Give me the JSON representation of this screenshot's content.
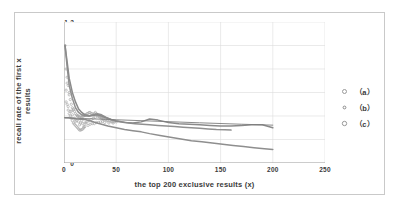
{
  "chart_data": {
    "type": "scatter",
    "title": "",
    "xlabel": "the top 200 exclusive results (x)",
    "ylabel_line1": "recall rate of the first x",
    "ylabel_line2": "results",
    "xlim": [
      0,
      250
    ],
    "ylim": [
      0,
      1.2
    ],
    "xticks": [
      0,
      50,
      100,
      150,
      200,
      250
    ],
    "yticks": [
      0,
      0.2,
      0.4,
      0.6,
      0.8,
      1,
      1.2
    ],
    "xtick_labels": [
      "0",
      "50",
      "100",
      "150",
      "200",
      "250"
    ],
    "ytick_labels": [
      "0",
      "0.2",
      "0.4",
      "0.6",
      "0.8",
      "1",
      "1.2"
    ],
    "grid": "both",
    "legend_position": "right",
    "legend": [
      {
        "label": "（a）",
        "marker": "circle-open",
        "color": "#9a9a9a"
      },
      {
        "label": "（b）",
        "marker": "circle-open",
        "color": "#8a8a8a"
      },
      {
        "label": "（c）",
        "marker": "circle-open",
        "color": "#8e8e8e"
      }
    ],
    "series": [
      {
        "name": "（a）",
        "color": "#909090",
        "x": [
          1,
          3,
          5,
          8,
          11,
          14,
          17,
          20,
          24,
          28,
          32,
          36,
          40,
          45,
          50,
          56,
          62,
          68,
          75,
          82,
          90,
          98,
          106,
          114,
          122,
          130,
          138,
          146,
          154,
          160
        ],
        "y": [
          1.0,
          0.82,
          0.66,
          0.55,
          0.47,
          0.43,
          0.41,
          0.4,
          0.4,
          0.41,
          0.42,
          0.41,
          0.39,
          0.37,
          0.36,
          0.35,
          0.34,
          0.335,
          0.33,
          0.325,
          0.32,
          0.315,
          0.31,
          0.305,
          0.3,
          0.295,
          0.29,
          0.285,
          0.282,
          0.28
        ]
      },
      {
        "name": "（b）",
        "color": "#8a8a8a",
        "x": [
          1,
          3,
          5,
          8,
          11,
          14,
          17,
          20,
          24,
          28,
          32,
          36,
          40,
          45,
          50,
          58,
          66,
          74,
          82,
          90,
          100,
          110,
          120,
          130,
          140,
          150,
          160,
          170,
          180,
          190,
          200
        ],
        "y": [
          1.0,
          0.86,
          0.72,
          0.6,
          0.52,
          0.46,
          0.43,
          0.41,
          0.4,
          0.405,
          0.41,
          0.4,
          0.385,
          0.37,
          0.355,
          0.345,
          0.34,
          0.35,
          0.375,
          0.365,
          0.345,
          0.335,
          0.33,
          0.325,
          0.32,
          0.315,
          0.315,
          0.32,
          0.325,
          0.325,
          0.3
        ]
      },
      {
        "name": "（c）",
        "color": "#8e8e8e",
        "x": [
          1,
          4,
          8,
          12,
          16,
          20,
          25,
          30,
          36,
          42,
          50,
          58,
          66,
          74,
          82,
          92,
          102,
          112,
          122,
          132,
          142,
          152,
          162,
          172,
          182,
          192,
          200
        ],
        "y": [
          0.385,
          0.385,
          0.38,
          0.375,
          0.372,
          0.37,
          0.36,
          0.345,
          0.33,
          0.315,
          0.3,
          0.285,
          0.275,
          0.265,
          0.25,
          0.235,
          0.22,
          0.205,
          0.19,
          0.18,
          0.17,
          0.16,
          0.15,
          0.14,
          0.13,
          0.122,
          0.115
        ]
      },
      {
        "name": "trend-flat",
        "color": "#7d7d7d",
        "x": [
          0,
          20,
          50,
          90,
          130,
          170,
          200
        ],
        "y": [
          0.385,
          0.378,
          0.368,
          0.355,
          0.342,
          0.33,
          0.322
        ]
      }
    ],
    "scatter_cluster": {
      "note": "dense marker cloud near origin",
      "x": [
        1,
        2,
        2,
        3,
        3,
        4,
        4,
        5,
        5,
        6,
        6,
        7,
        7,
        8,
        8,
        9,
        9,
        10,
        10,
        11,
        11,
        12,
        12,
        13,
        13,
        14,
        14,
        15,
        15,
        16,
        16,
        17,
        17,
        18,
        18,
        19,
        19,
        20,
        20,
        21,
        22,
        23,
        24,
        25,
        26,
        27,
        28,
        29,
        30,
        31,
        32,
        33,
        34,
        35,
        36,
        37,
        38,
        40,
        42,
        44,
        46,
        48,
        50,
        2,
        4,
        6,
        8,
        10,
        12,
        14,
        16,
        18,
        20,
        22,
        24,
        26,
        28,
        30,
        32,
        34,
        36,
        38,
        5,
        9,
        13,
        17,
        21,
        25,
        29,
        33,
        37,
        41,
        45,
        3,
        7,
        11,
        15,
        19,
        23,
        27,
        31,
        35,
        39,
        43,
        47
      ],
      "y": [
        1.0,
        0.8,
        0.62,
        0.73,
        0.5,
        0.66,
        0.45,
        0.58,
        0.42,
        0.54,
        0.4,
        0.5,
        0.38,
        0.47,
        0.36,
        0.45,
        0.34,
        0.44,
        0.33,
        0.42,
        0.32,
        0.41,
        0.31,
        0.4,
        0.3,
        0.4,
        0.29,
        0.39,
        0.28,
        0.39,
        0.28,
        0.39,
        0.285,
        0.4,
        0.29,
        0.4,
        0.3,
        0.41,
        0.31,
        0.41,
        0.42,
        0.42,
        0.43,
        0.43,
        0.42,
        0.42,
        0.41,
        0.42,
        0.43,
        0.42,
        0.41,
        0.4,
        0.4,
        0.39,
        0.39,
        0.38,
        0.38,
        0.37,
        0.36,
        0.36,
        0.35,
        0.35,
        0.35,
        0.52,
        0.48,
        0.44,
        0.41,
        0.38,
        0.36,
        0.35,
        0.34,
        0.335,
        0.34,
        0.35,
        0.36,
        0.37,
        0.38,
        0.39,
        0.4,
        0.39,
        0.38,
        0.37,
        0.6,
        0.46,
        0.4,
        0.36,
        0.34,
        0.33,
        0.335,
        0.345,
        0.355,
        0.36,
        0.355,
        0.68,
        0.44,
        0.355,
        0.325,
        0.31,
        0.32,
        0.335,
        0.345,
        0.35,
        0.345,
        0.34,
        0.34
      ]
    }
  }
}
